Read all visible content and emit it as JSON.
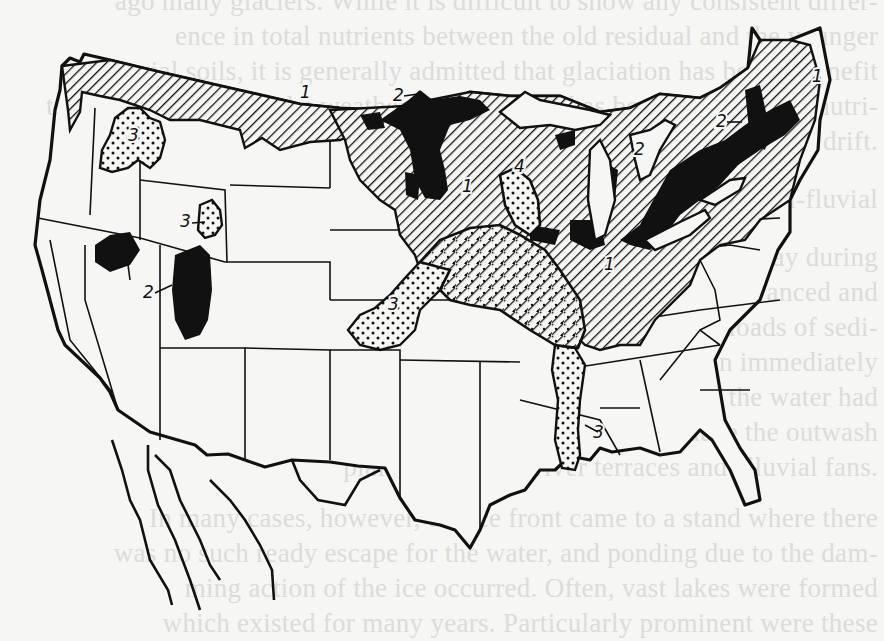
{
  "figure": {
    "region_labels": [
      {
        "id": "r1-montana",
        "label": "1",
        "x": 300,
        "y": 98
      },
      {
        "id": "r1-minnesota",
        "label": "1",
        "x": 462,
        "y": 192
      },
      {
        "id": "r1-indiana",
        "label": "1",
        "x": 604,
        "y": 270
      },
      {
        "id": "r1-maine",
        "label": "1",
        "x": 812,
        "y": 82
      },
      {
        "id": "r2-north-mn",
        "label": "2",
        "x": 393,
        "y": 101
      },
      {
        "id": "r2-michigan",
        "label": "2",
        "x": 634,
        "y": 155
      },
      {
        "id": "r2-new-york",
        "label": "2",
        "x": 716,
        "y": 127
      },
      {
        "id": "r2-nevada",
        "label": "2",
        "x": 143,
        "y": 298
      },
      {
        "id": "r3-washington",
        "label": "3",
        "x": 128,
        "y": 141
      },
      {
        "id": "r3-wyoming",
        "label": "3",
        "x": 180,
        "y": 227
      },
      {
        "id": "r3-kansas",
        "label": "3",
        "x": 388,
        "y": 310
      },
      {
        "id": "r3-mississippi",
        "label": "3",
        "x": 593,
        "y": 438
      },
      {
        "id": "r4-wisconsin",
        "label": "4",
        "x": 514,
        "y": 172
      }
    ],
    "legend_codes": [
      "1",
      "2",
      "3",
      "4"
    ],
    "patterns": {
      "1": "diagonal-hatch",
      "2": "solid-black",
      "3": "dotted",
      "4": "dotted-hatch"
    }
  },
  "bleed_through_text": [
    {
      "text": "ago many glaciers. While it is difficult to show any consistent differ-",
      "y": 6
    },
    {
      "text": "ence in total nutrients between the old residual and the younger",
      "y": 41
    },
    {
      "text": "glacial soils, it is generally admitted that glaciation has been a benefit",
      "y": 76
    },
    {
      "text": "to agriculture in that the weathering of the soil has been checked and nutri-",
      "y": 111
    },
    {
      "text": "ents have been made available in the fresh rock flour of the glacial drift.",
      "y": 146
    },
    {
      "text": "171. Glacial-fluvial",
      "y": 204
    },
    {
      "text": "For a considerable period, in fact continuing even today during",
      "y": 262
    },
    {
      "text": "the summer, large amounts of water from the glaciers advanced and",
      "y": 297
    },
    {
      "text": "retreated across the ice sheet carrying enormous loads of sedi-",
      "y": 332
    },
    {
      "text": "ment charged by such streams were either dumped down immediately",
      "y": 367
    },
    {
      "text": "or carried to other areas for deposition. As long as the water had",
      "y": 402
    },
    {
      "text": "ready egress, it flowed rapidly away to produce the outwash",
      "y": 437
    },
    {
      "text": "plain, valley fill, river terraces and alluvial fans.",
      "y": 472
    },
    {
      "text": "In many cases, however, the ice front came to a stand where there",
      "y": 523
    },
    {
      "text": "was no such ready escape for the water, and ponding due to the dam-",
      "y": 558
    },
    {
      "text": "ming action of the ice occurred. Often, vast lakes were formed",
      "y": 593
    },
    {
      "text": "which existed for many years. Particularly prominent were these",
      "y": 628
    }
  ],
  "colors": {
    "paper": "#f6f6f4",
    "ink": "#111111",
    "bleed": "#dcdcda"
  }
}
